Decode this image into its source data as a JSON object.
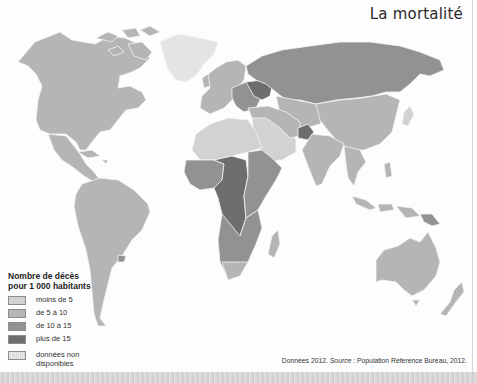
{
  "title": "La mortalité",
  "legend": {
    "title_line1": "Nombre de décès",
    "title_line2": "pour 1 000 habitants",
    "classes": [
      {
        "label": "moins de 5",
        "color": "#d2d2d2"
      },
      {
        "label": "de 5 à 10",
        "color": "#b5b5b5"
      },
      {
        "label": "de 10 à 15",
        "color": "#929292"
      },
      {
        "label": "plus de 15",
        "color": "#6e6e6e"
      }
    ],
    "nodata": {
      "label_line1": "données non",
      "label_line2": "disponibles",
      "color": "#e4e4e4"
    }
  },
  "source": {
    "prefix": "Données 2012.",
    "source_label": "Source",
    "text": ": Population Reference Bureau, 2012."
  },
  "regions": {
    "north_america": "de 5 à 10",
    "greenland": "données non disponibles",
    "central_america": "moins de 5",
    "south_america": "de 5 à 10",
    "western_europe": "de 5 à 10",
    "eastern_europe": "de 10 à 15",
    "ukraine_belarus": "plus de 15",
    "russia": "de 10 à 15",
    "north_africa": "moins de 5",
    "sahel_central_africa": "plus de 15",
    "east_africa": "de 10 à 15",
    "southern_africa": "de 10 à 15",
    "middle_east_arabia": "moins de 5",
    "afghanistan": "plus de 15",
    "central_asia": "de 5 à 10",
    "china": "de 5 à 10",
    "india": "de 5 à 10",
    "southeast_asia": "de 5 à 10",
    "australia": "de 5 à 10",
    "madagascar": "de 5 à 10"
  }
}
